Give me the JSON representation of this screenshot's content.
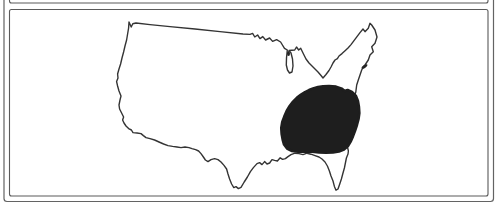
{
  "figure": {
    "type": "map-figure",
    "map_name": "continental-united-states-outline",
    "shaded_region_name": "southeastern-united-states",
    "colors": {
      "background": "#ffffff",
      "outer_frame_line": "#636363",
      "panel_border_line": "#5a5a5a",
      "map_outline": "#343434",
      "shaded_region_fill": "#1e1e1e",
      "lake_mark_fill": "#242424"
    }
  }
}
